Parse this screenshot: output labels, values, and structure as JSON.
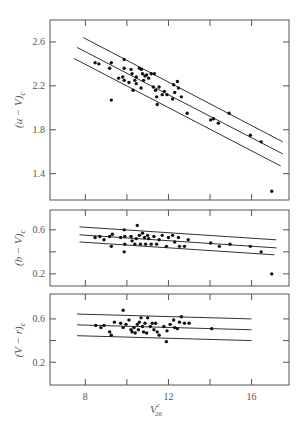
{
  "chart_data": [
    {
      "type": "scatter",
      "panel": "top",
      "title": "",
      "xlabel": "V26^c",
      "ylabel": "(u - V)c",
      "xlim": [
        6.3,
        17.8
      ],
      "ylim": [
        1.16,
        2.8
      ],
      "xticks": [
        8,
        10,
        12,
        14,
        16
      ],
      "xtick_labels": [],
      "yticks": [
        1.4,
        1.8,
        2.2,
        2.6
      ],
      "ytick_labels": [
        "1.4",
        "1.8",
        "2.2",
        "2.6"
      ],
      "grid": false,
      "legend": null,
      "lines": [
        {
          "name": "upper",
          "x": [
            7.9,
            17.5
          ],
          "y": [
            2.64,
            1.69
          ]
        },
        {
          "name": "fit",
          "x": [
            7.6,
            17.5
          ],
          "y": [
            2.55,
            1.58
          ]
        },
        {
          "name": "lower",
          "x": [
            7.45,
            17.4
          ],
          "y": [
            2.45,
            1.47
          ]
        }
      ],
      "points": [
        [
          8.47,
          2.41
        ],
        [
          8.65,
          2.4
        ],
        [
          9.17,
          2.36
        ],
        [
          9.25,
          2.41
        ],
        [
          9.25,
          2.07
        ],
        [
          9.6,
          2.27
        ],
        [
          9.87,
          2.44
        ],
        [
          9.87,
          2.36
        ],
        [
          9.87,
          2.25
        ],
        [
          9.8,
          2.28
        ],
        [
          10.1,
          2.23
        ],
        [
          10.2,
          2.35
        ],
        [
          10.25,
          2.31
        ],
        [
          10.3,
          2.16
        ],
        [
          10.38,
          2.25
        ],
        [
          10.45,
          2.28
        ],
        [
          10.45,
          2.22
        ],
        [
          10.6,
          2.36
        ],
        [
          10.68,
          2.18
        ],
        [
          10.7,
          2.35
        ],
        [
          10.75,
          2.31
        ],
        [
          10.8,
          2.25
        ],
        [
          10.87,
          2.29
        ],
        [
          10.95,
          2.3
        ],
        [
          11.05,
          2.27
        ],
        [
          11.17,
          2.31
        ],
        [
          11.27,
          2.19
        ],
        [
          11.32,
          2.31
        ],
        [
          11.38,
          2.16
        ],
        [
          11.43,
          2.1
        ],
        [
          11.46,
          2.03
        ],
        [
          11.55,
          2.19
        ],
        [
          11.7,
          2.12
        ],
        [
          11.8,
          2.15
        ],
        [
          11.93,
          2.12
        ],
        [
          12.2,
          2.08
        ],
        [
          12.25,
          2.21
        ],
        [
          12.3,
          2.14
        ],
        [
          12.43,
          2.24
        ],
        [
          12.48,
          2.18
        ],
        [
          12.62,
          2.1
        ],
        [
          12.9,
          1.95
        ],
        [
          14.03,
          1.89
        ],
        [
          14.17,
          1.9
        ],
        [
          14.4,
          1.86
        ],
        [
          14.92,
          1.95
        ],
        [
          15.94,
          1.75
        ],
        [
          16.46,
          1.69
        ],
        [
          16.97,
          1.24
        ]
      ]
    },
    {
      "type": "scatter",
      "panel": "middle",
      "title": "",
      "xlabel": "V26^c",
      "ylabel": "(b - V)c",
      "xlim": [
        6.3,
        17.8
      ],
      "ylim": [
        0.09,
        0.78
      ],
      "xticks": [
        8,
        10,
        12,
        14,
        16
      ],
      "xtick_labels": [],
      "yticks": [
        0.2,
        0.4,
        0.6
      ],
      "ytick_labels": [
        "0.2",
        "",
        "0.6"
      ],
      "grid": false,
      "legend": null,
      "lines": [
        {
          "name": "upper",
          "x": [
            7.72,
            17.2
          ],
          "y": [
            0.627,
            0.509
          ]
        },
        {
          "name": "fit",
          "x": [
            7.72,
            17.2
          ],
          "y": [
            0.555,
            0.436
          ]
        },
        {
          "name": "lower",
          "x": [
            7.72,
            17.1
          ],
          "y": [
            0.49,
            0.373
          ]
        }
      ],
      "points": [
        [
          8.47,
          0.53
        ],
        [
          8.7,
          0.54
        ],
        [
          8.9,
          0.51
        ],
        [
          9.17,
          0.54
        ],
        [
          9.25,
          0.45
        ],
        [
          9.3,
          0.56
        ],
        [
          9.7,
          0.53
        ],
        [
          9.87,
          0.6
        ],
        [
          9.87,
          0.4
        ],
        [
          9.9,
          0.47
        ],
        [
          9.9,
          0.54
        ],
        [
          10.2,
          0.54
        ],
        [
          10.25,
          0.5
        ],
        [
          10.38,
          0.47
        ],
        [
          10.45,
          0.52
        ],
        [
          10.5,
          0.64
        ],
        [
          10.6,
          0.55
        ],
        [
          10.65,
          0.47
        ],
        [
          10.75,
          0.57
        ],
        [
          10.85,
          0.53
        ],
        [
          10.9,
          0.47
        ],
        [
          11.0,
          0.55
        ],
        [
          11.05,
          0.52
        ],
        [
          11.17,
          0.47
        ],
        [
          11.3,
          0.54
        ],
        [
          11.43,
          0.47
        ],
        [
          11.55,
          0.51
        ],
        [
          11.7,
          0.55
        ],
        [
          11.9,
          0.45
        ],
        [
          12.0,
          0.53
        ],
        [
          12.2,
          0.55
        ],
        [
          12.3,
          0.49
        ],
        [
          12.48,
          0.53
        ],
        [
          12.53,
          0.45
        ],
        [
          12.77,
          0.45
        ],
        [
          12.95,
          0.51
        ],
        [
          14.03,
          0.48
        ],
        [
          14.45,
          0.45
        ],
        [
          14.96,
          0.47
        ],
        [
          15.94,
          0.45
        ],
        [
          16.46,
          0.4
        ],
        [
          16.97,
          0.2
        ]
      ]
    },
    {
      "type": "scatter",
      "panel": "bottom",
      "title": "",
      "xlabel": "V26^c",
      "ylabel": "(V - r)c",
      "xlim": [
        6.3,
        17.8
      ],
      "ylim": [
        -0.01,
        0.83
      ],
      "xticks": [
        8,
        10,
        12,
        14,
        16
      ],
      "xtick_labels": [
        "8",
        "",
        "12",
        "",
        "16"
      ],
      "yticks": [
        0.2,
        0.4,
        0.6
      ],
      "ytick_labels": [
        "0.2",
        "",
        "0.6"
      ],
      "grid": false,
      "legend": null,
      "lines": [
        {
          "name": "upper",
          "x": [
            7.6,
            16.0
          ],
          "y": [
            0.645,
            0.6
          ]
        },
        {
          "name": "fit",
          "x": [
            7.6,
            16.0
          ],
          "y": [
            0.545,
            0.5
          ]
        },
        {
          "name": "lower",
          "x": [
            7.6,
            16.0
          ],
          "y": [
            0.445,
            0.4
          ]
        }
      ],
      "points": [
        [
          8.5,
          0.54
        ],
        [
          8.75,
          0.52
        ],
        [
          8.9,
          0.54
        ],
        [
          9.17,
          0.48
        ],
        [
          9.25,
          0.45
        ],
        [
          9.4,
          0.57
        ],
        [
          9.7,
          0.56
        ],
        [
          9.82,
          0.68
        ],
        [
          9.82,
          0.52
        ],
        [
          9.96,
          0.55
        ],
        [
          10.1,
          0.59
        ],
        [
          10.2,
          0.5
        ],
        [
          10.25,
          0.48
        ],
        [
          10.34,
          0.52
        ],
        [
          10.4,
          0.47
        ],
        [
          10.5,
          0.55
        ],
        [
          10.55,
          0.5
        ],
        [
          10.6,
          0.57
        ],
        [
          10.68,
          0.61
        ],
        [
          10.75,
          0.53
        ],
        [
          10.8,
          0.48
        ],
        [
          10.87,
          0.56
        ],
        [
          10.95,
          0.47
        ],
        [
          11.0,
          0.61
        ],
        [
          11.13,
          0.53
        ],
        [
          11.22,
          0.56
        ],
        [
          11.3,
          0.5
        ],
        [
          11.38,
          0.56
        ],
        [
          11.46,
          0.48
        ],
        [
          11.55,
          0.45
        ],
        [
          11.78,
          0.53
        ],
        [
          11.9,
          0.39
        ],
        [
          11.93,
          0.49
        ],
        [
          12.08,
          0.55
        ],
        [
          12.25,
          0.59
        ],
        [
          12.3,
          0.52
        ],
        [
          12.43,
          0.51
        ],
        [
          12.53,
          0.57
        ],
        [
          12.62,
          0.62
        ],
        [
          12.77,
          0.56
        ],
        [
          12.99,
          0.56
        ],
        [
          14.08,
          0.51
        ]
      ]
    }
  ],
  "labels": {
    "ylabel_top_main": "(u − V)",
    "ylabel_top_sub": "c",
    "ylabel_mid_main": "(b − V)",
    "ylabel_mid_sub": "c",
    "ylabel_bot_main": "(V − r)",
    "ylabel_bot_sub": "c",
    "xlabel_main": "V",
    "xlabel_sup": "c",
    "xlabel_sub": "26"
  },
  "colors": {
    "points": "#111111",
    "lines": "#333333",
    "frame": "#555555"
  }
}
